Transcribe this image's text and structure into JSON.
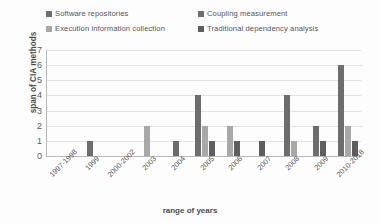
{
  "chart_data": {
    "type": "bar",
    "title": "",
    "xlabel": "range of years",
    "ylabel": "span of CIA methods",
    "ylim": [
      0,
      7
    ],
    "yticks": [
      0,
      1,
      2,
      3,
      4,
      5,
      6,
      7
    ],
    "grid": true,
    "legend_position": "top",
    "categories": [
      "1997-1998",
      "1999",
      "2000-2002",
      "2003",
      "2004",
      "2005",
      "2006",
      "2007",
      "2008",
      "2009",
      "2010-2018"
    ],
    "series": [
      {
        "name": "Software repositories",
        "color": "#6d6d6d",
        "values": [
          0,
          1,
          0,
          0,
          1,
          4,
          0,
          0,
          4,
          2,
          6
        ]
      },
      {
        "name": "Coupling measurement",
        "color": "#a8a8a8",
        "values": [
          0,
          0,
          0,
          2,
          0,
          2,
          2,
          0,
          1,
          0,
          2
        ]
      },
      {
        "name": "Execution information collection",
        "color": "#cfcfcf",
        "values": [
          0,
          0,
          0,
          0,
          0,
          0,
          0,
          0,
          0,
          0,
          0
        ]
      },
      {
        "name": "Traditional dependency analysis",
        "color": "#5e5e5e",
        "values": [
          0,
          0,
          0,
          0,
          0,
          1,
          1,
          1,
          0,
          1,
          1
        ]
      }
    ]
  },
  "legend": {
    "items": [
      {
        "label": "Software repositories",
        "color": "#6d6d6d"
      },
      {
        "label": "Coupling measurement",
        "color": "#6d6d6d"
      },
      {
        "label": "Execution information collection",
        "color": "#a8a8a8"
      },
      {
        "label": "Traditional dependency analysis",
        "color": "#5e5e5e"
      }
    ]
  },
  "axes": {
    "y_title": "span of CIA methods",
    "x_title": "range of years",
    "y_labels": [
      "7",
      "6",
      "5",
      "4",
      "3",
      "2",
      "1",
      "0"
    ],
    "x_labels": [
      "1997-1998",
      "1999",
      "2000-2002",
      "2003",
      "2004",
      "2005",
      "2006",
      "2007",
      "2008",
      "2009",
      "2010-2018"
    ]
  }
}
